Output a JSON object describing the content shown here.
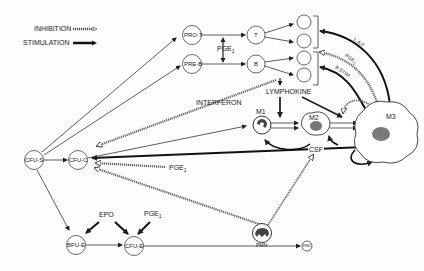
{
  "legend": {
    "inhibition": "INHIBITION",
    "stimulation": "STIMULATION"
  },
  "nodes": {
    "pro_t": "PRO-T",
    "pre_b": "PRE-B",
    "t": "T",
    "b": "B",
    "cfu_s": "CFU-S",
    "cfu_c": "CFU-C",
    "bfu_e": "BFU-E",
    "cfu_e": "CFU-E",
    "rbc": "RBC",
    "m1": "M1",
    "m2": "M2",
    "m3": "M3",
    "pmn": "PMN"
  },
  "labels": {
    "pge1_tb": "PGE",
    "pge1_tb_sub": "1",
    "pge1_cfuc": "PGE",
    "pge1_cfuc_sub": "1",
    "pge1_cfue": "PGE",
    "pge1_cfue_sub": "1",
    "pge1_m3": "PGE",
    "pge1_m3_sub": "1",
    "epo": "EPO",
    "lymphokine": "LYMPHOKINE",
    "interferon": "INTERFERON",
    "csf": "CSF",
    "laf": "L.A.F",
    "bstim": "B STIM"
  },
  "colors": {
    "ink": "#222222",
    "inhibition_fill": "#ffffff",
    "cell_nucleus": "#7a7a7a"
  }
}
